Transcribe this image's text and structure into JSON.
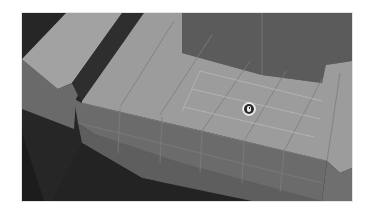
{
  "viewport": {
    "kind": "3d-modeling-viewport",
    "mode": "face-select",
    "object": "block-mesh",
    "selected_faces": "3x2 grid on top surface",
    "colors": {
      "background_dark": "#262626",
      "ground_far": "#5b5b5b",
      "top_face": "#9c9c9c",
      "side_face": "#6d6d6d",
      "side_face_dark": "#5e5e5e",
      "slot": "#2e2e2e",
      "edge": "#7a7a7a",
      "selection_edge": "#b9b9b9"
    }
  },
  "cursor": {
    "icon": "mouse-cursor-icon",
    "label": "Mouse cursor"
  }
}
